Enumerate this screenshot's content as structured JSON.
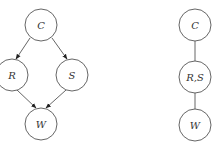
{
  "diagrams": [
    {
      "name": "bayesian-network",
      "directed": true,
      "nodes": [
        {
          "id": "C",
          "label": "C"
        },
        {
          "id": "R",
          "label": "R"
        },
        {
          "id": "S",
          "label": "S"
        },
        {
          "id": "W",
          "label": "W"
        }
      ],
      "edges": [
        {
          "from": "C",
          "to": "R"
        },
        {
          "from": "C",
          "to": "S"
        },
        {
          "from": "R",
          "to": "W"
        },
        {
          "from": "S",
          "to": "W"
        }
      ]
    },
    {
      "name": "junction-tree",
      "directed": false,
      "nodes": [
        {
          "id": "C",
          "label": "C"
        },
        {
          "id": "RS",
          "label": "R,S"
        },
        {
          "id": "W",
          "label": "W"
        }
      ],
      "edges": [
        {
          "from": "C",
          "to": "RS"
        },
        {
          "from": "RS",
          "to": "W"
        }
      ]
    }
  ],
  "colors": {
    "stroke": "#555555",
    "text": "#333333",
    "background": "#ffffff"
  }
}
